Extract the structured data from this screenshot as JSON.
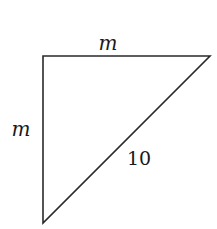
{
  "diagram": {
    "type": "right-triangle",
    "labels": {
      "top_side": "m",
      "left_side": "m",
      "hypotenuse": "10"
    },
    "colors": {
      "stroke": "#2a2a2a",
      "text": "#1a1a1a",
      "background": "#ffffff"
    }
  }
}
